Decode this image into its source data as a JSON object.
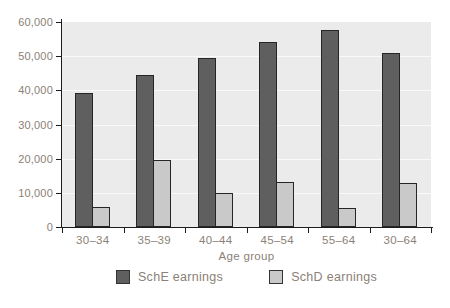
{
  "chart_data": {
    "type": "bar",
    "title": "",
    "categories": [
      "30–34",
      "35–39",
      "40–44",
      "45–54",
      "55–64",
      "30–64"
    ],
    "series": [
      {
        "name": "SchE earnings",
        "values": [
          39200,
          44500,
          49500,
          54000,
          57800,
          51000
        ],
        "color": "#5f5f5f"
      },
      {
        "name": "SchD earnings",
        "values": [
          5900,
          19700,
          10000,
          13200,
          5500,
          12800
        ],
        "color": "#c9c9c9"
      }
    ],
    "xlabel": "Age group",
    "ylabel": "",
    "ylim": [
      0,
      60000
    ],
    "ytick_interval": 10000,
    "ytick_labels": [
      "0",
      "10,000",
      "20,000",
      "30,000",
      "40,000",
      "50,000",
      "60,000"
    ],
    "grid": true,
    "legend_position": "bottom"
  },
  "colors": {
    "plot_background": "#ebebeb",
    "gridline": "#f9f9f9",
    "axis": "#1c1c1c",
    "text": "#8b8177",
    "sche_bar": "#5f5f5f",
    "schd_bar": "#c9c9c9",
    "bar_border": "#262626"
  }
}
